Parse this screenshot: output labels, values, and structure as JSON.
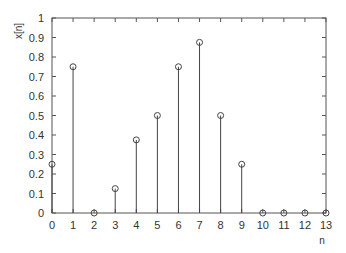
{
  "chart_data": {
    "type": "stem",
    "title": "",
    "xlabel": "n",
    "ylabel": "x[n]",
    "x": [
      0,
      1,
      2,
      3,
      4,
      5,
      6,
      7,
      8,
      9,
      10,
      11,
      12,
      13
    ],
    "values": [
      0.25,
      0.75,
      0,
      0.125,
      0.375,
      0.5,
      0.75,
      0.875,
      0.5,
      0.25,
      0,
      0,
      0,
      0
    ],
    "xlim": [
      0,
      13
    ],
    "ylim": [
      0,
      1
    ],
    "xticks": [
      "0",
      "1",
      "2",
      "3",
      "4",
      "5",
      "6",
      "7",
      "8",
      "9",
      "10",
      "11",
      "12",
      "13"
    ],
    "yticks": [
      "0",
      "0.1",
      "0.2",
      "0.3",
      "0.4",
      "0.5",
      "0.6",
      "0.7",
      "0.8",
      "0.9",
      "1"
    ],
    "grid": false,
    "legend": null,
    "marker": "open-circle",
    "line_color": "#444444"
  }
}
